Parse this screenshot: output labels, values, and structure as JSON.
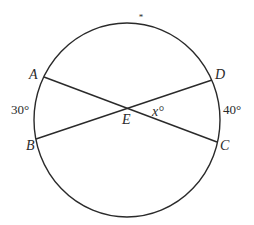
{
  "diagram": {
    "type": "circle-with-intersecting-chords",
    "stroke_color": "#2a2a2a",
    "circle": {
      "cx": 127,
      "cy": 120,
      "r": 95
    },
    "points": {
      "A": {
        "label": "A",
        "x": 44,
        "y": 77
      },
      "B": {
        "label": "B",
        "x": 36,
        "y": 139
      },
      "C": {
        "label": "C",
        "x": 217,
        "y": 142
      },
      "D": {
        "label": "D",
        "x": 212,
        "y": 80
      },
      "E": {
        "label": "E",
        "x": 127,
        "y": 109
      }
    },
    "chords": [
      {
        "from": "A",
        "to": "C"
      },
      {
        "from": "B",
        "to": "D"
      }
    ],
    "arc_labels": {
      "AB": "30°",
      "DC": "40°"
    },
    "angle_label": "x°",
    "top_marker": "*"
  }
}
